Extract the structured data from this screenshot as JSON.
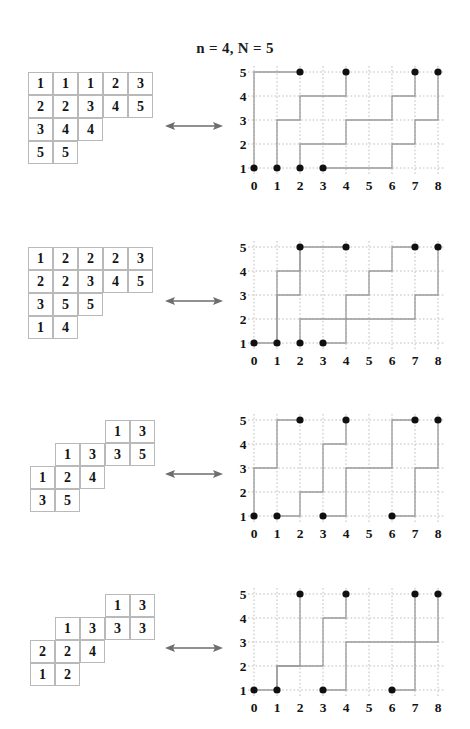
{
  "title": "n = 4, N = 5",
  "colors": {
    "grid": "#bdbdbd",
    "path": "#9a9a9a",
    "dot": "#101010",
    "cell_border": "#b9b9b9",
    "text": "#141414",
    "arrow": "#6d6d6d"
  },
  "arrow": {
    "glyph": "double-headed-arrow",
    "label": "corresponds to"
  },
  "axis": {
    "x_ticks": [
      "0",
      "1",
      "2",
      "3",
      "4",
      "5",
      "6",
      "7",
      "8"
    ],
    "y_ticks": [
      "1",
      "2",
      "3",
      "4",
      "5"
    ],
    "xlim": [
      0,
      8
    ],
    "ylim": [
      1,
      5
    ],
    "grid": "dotted"
  },
  "pairs": [
    {
      "id": "pair-1",
      "tableau": {
        "name": "tableau-1",
        "shape": "straight",
        "rows": [
          {
            "offset": 0,
            "values": [
              "1",
              "1",
              "1",
              "2",
              "3"
            ]
          },
          {
            "offset": 0,
            "values": [
              "2",
              "2",
              "3",
              "4",
              "5"
            ]
          },
          {
            "offset": 0,
            "values": [
              "3",
              "4",
              "4"
            ]
          },
          {
            "offset": 0,
            "values": [
              "5",
              "5"
            ]
          }
        ]
      },
      "chart_data": {
        "type": "line",
        "title": "",
        "xlabel": "",
        "ylabel": "",
        "x": [
          0,
          1,
          2,
          3,
          4,
          5,
          6,
          7,
          8
        ],
        "ylim": [
          1,
          5
        ],
        "xlim": [
          0,
          8
        ],
        "series": [
          {
            "name": "path-1",
            "points": [
              [
                0,
                1
              ],
              [
                0,
                5
              ],
              [
                2,
                5
              ]
            ]
          },
          {
            "name": "path-2",
            "points": [
              [
                1,
                1
              ],
              [
                1,
                3
              ],
              [
                2,
                3
              ],
              [
                2,
                4
              ],
              [
                4,
                4
              ],
              [
                4,
                5
              ]
            ]
          },
          {
            "name": "path-3",
            "points": [
              [
                2,
                1
              ],
              [
                2,
                2
              ],
              [
                4,
                2
              ],
              [
                4,
                3
              ],
              [
                6,
                3
              ],
              [
                6,
                4
              ],
              [
                7,
                4
              ],
              [
                7,
                5
              ]
            ]
          },
          {
            "name": "path-4",
            "points": [
              [
                3,
                1
              ],
              [
                6,
                1
              ],
              [
                6,
                2
              ],
              [
                7,
                2
              ],
              [
                7,
                3
              ],
              [
                8,
                3
              ],
              [
                8,
                5
              ]
            ]
          }
        ],
        "dots": [
          [
            0,
            1
          ],
          [
            1,
            1
          ],
          [
            2,
            1
          ],
          [
            3,
            1
          ],
          [
            2,
            5
          ],
          [
            4,
            5
          ],
          [
            7,
            5
          ],
          [
            8,
            5
          ]
        ]
      }
    },
    {
      "id": "pair-2",
      "tableau": {
        "name": "tableau-2",
        "shape": "straight",
        "rows": [
          {
            "offset": 0,
            "values": [
              "1",
              "2",
              "2",
              "2",
              "3"
            ]
          },
          {
            "offset": 0,
            "values": [
              "2",
              "2",
              "3",
              "4",
              "5"
            ]
          },
          {
            "offset": 0,
            "values": [
              "3",
              "5",
              "5"
            ]
          },
          {
            "offset": 0,
            "values": [
              "1",
              "4"
            ]
          }
        ]
      },
      "chart_data": {
        "type": "line",
        "title": "",
        "xlabel": "",
        "ylabel": "",
        "x": [
          0,
          1,
          2,
          3,
          4,
          5,
          6,
          7,
          8
        ],
        "ylim": [
          1,
          5
        ],
        "xlim": [
          0,
          8
        ],
        "series": [
          {
            "name": "path-1",
            "points": [
              [
                0,
                1
              ],
              [
                1,
                1
              ],
              [
                1,
                4
              ],
              [
                2,
                4
              ],
              [
                2,
                5
              ],
              [
                4,
                5
              ]
            ]
          },
          {
            "name": "path-2",
            "points": [
              [
                1,
                1
              ],
              [
                1,
                3
              ],
              [
                2,
                3
              ],
              [
                2,
                5
              ]
            ]
          },
          {
            "name": "path-3",
            "points": [
              [
                2,
                1
              ],
              [
                2,
                2
              ],
              [
                4,
                2
              ],
              [
                4,
                3
              ],
              [
                5,
                3
              ],
              [
                5,
                4
              ],
              [
                6,
                4
              ],
              [
                6,
                5
              ],
              [
                7,
                5
              ]
            ]
          },
          {
            "name": "path-4",
            "points": [
              [
                3,
                1
              ],
              [
                4,
                1
              ],
              [
                4,
                2
              ],
              [
                7,
                2
              ],
              [
                7,
                3
              ],
              [
                8,
                3
              ],
              [
                8,
                5
              ]
            ]
          }
        ],
        "dots": [
          [
            0,
            1
          ],
          [
            1,
            1
          ],
          [
            2,
            1
          ],
          [
            3,
            1
          ],
          [
            2,
            5
          ],
          [
            4,
            5
          ],
          [
            7,
            5
          ],
          [
            8,
            5
          ]
        ]
      }
    },
    {
      "id": "pair-3",
      "tableau": {
        "name": "tableau-3",
        "shape": "skew",
        "rows": [
          {
            "offset": 3,
            "values": [
              "1",
              "3"
            ]
          },
          {
            "offset": 1,
            "values": [
              "1",
              "3",
              "3",
              "5"
            ]
          },
          {
            "offset": 0,
            "values": [
              "1",
              "2",
              "4"
            ]
          },
          {
            "offset": 0,
            "values": [
              "3",
              "5"
            ]
          }
        ]
      },
      "chart_data": {
        "type": "line",
        "title": "",
        "xlabel": "",
        "ylabel": "",
        "x": [
          0,
          1,
          2,
          3,
          4,
          5,
          6,
          7,
          8
        ],
        "ylim": [
          1,
          5
        ],
        "xlim": [
          0,
          8
        ],
        "series": [
          {
            "name": "path-1",
            "points": [
              [
                0,
                1
              ],
              [
                0,
                3
              ],
              [
                1,
                3
              ],
              [
                1,
                5
              ],
              [
                2,
                5
              ]
            ]
          },
          {
            "name": "path-2",
            "points": [
              [
                1,
                1
              ],
              [
                2,
                1
              ],
              [
                2,
                2
              ],
              [
                3,
                2
              ],
              [
                3,
                4
              ],
              [
                4,
                4
              ],
              [
                4,
                5
              ]
            ]
          },
          {
            "name": "path-3",
            "points": [
              [
                3,
                1
              ],
              [
                4,
                1
              ],
              [
                4,
                3
              ],
              [
                6,
                3
              ],
              [
                6,
                5
              ],
              [
                7,
                5
              ]
            ]
          },
          {
            "name": "path-4",
            "points": [
              [
                6,
                1
              ],
              [
                7,
                1
              ],
              [
                7,
                3
              ],
              [
                8,
                3
              ],
              [
                8,
                5
              ]
            ]
          }
        ],
        "dots": [
          [
            0,
            1
          ],
          [
            1,
            1
          ],
          [
            3,
            1
          ],
          [
            6,
            1
          ],
          [
            2,
            5
          ],
          [
            4,
            5
          ],
          [
            7,
            5
          ],
          [
            8,
            5
          ]
        ]
      }
    },
    {
      "id": "pair-4",
      "tableau": {
        "name": "tableau-4",
        "shape": "skew",
        "rows": [
          {
            "offset": 3,
            "values": [
              "1",
              "3"
            ]
          },
          {
            "offset": 1,
            "values": [
              "1",
              "3",
              "3",
              "3"
            ]
          },
          {
            "offset": 0,
            "values": [
              "2",
              "2",
              "4"
            ]
          },
          {
            "offset": 0,
            "values": [
              "1",
              "2"
            ]
          }
        ]
      },
      "chart_data": {
        "type": "line",
        "title": "",
        "xlabel": "",
        "ylabel": "",
        "x": [
          0,
          1,
          2,
          3,
          4,
          5,
          6,
          7,
          8
        ],
        "ylim": [
          1,
          5
        ],
        "xlim": [
          0,
          8
        ],
        "series": [
          {
            "name": "path-1",
            "points": [
              [
                0,
                1
              ],
              [
                1,
                1
              ],
              [
                1,
                2
              ],
              [
                2,
                2
              ],
              [
                2,
                5
              ]
            ]
          },
          {
            "name": "path-2",
            "points": [
              [
                1,
                1
              ],
              [
                1,
                2
              ],
              [
                3,
                2
              ],
              [
                3,
                4
              ],
              [
                4,
                4
              ],
              [
                4,
                5
              ]
            ]
          },
          {
            "name": "path-3",
            "points": [
              [
                3,
                1
              ],
              [
                4,
                1
              ],
              [
                4,
                3
              ],
              [
                7,
                3
              ],
              [
                7,
                5
              ]
            ]
          },
          {
            "name": "path-4",
            "points": [
              [
                6,
                1
              ],
              [
                7,
                1
              ],
              [
                7,
                3
              ],
              [
                8,
                3
              ],
              [
                8,
                5
              ]
            ]
          }
        ],
        "dots": [
          [
            0,
            1
          ],
          [
            1,
            1
          ],
          [
            3,
            1
          ],
          [
            6,
            1
          ],
          [
            2,
            5
          ],
          [
            4,
            5
          ],
          [
            7,
            5
          ],
          [
            8,
            5
          ]
        ]
      }
    }
  ]
}
